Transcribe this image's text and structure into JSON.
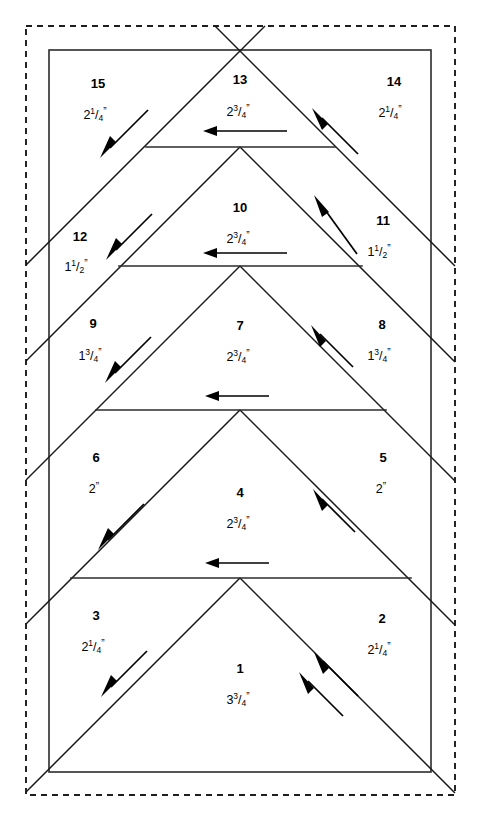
{
  "diagram": {
    "type": "technical-sewing-diagram",
    "colors": {
      "line": "#1b1b1b",
      "border": "#111111",
      "background": "#ffffff",
      "arrow": "#000000"
    },
    "outer_border": {
      "style": "dashed",
      "x": 26,
      "y": 26,
      "width": 429,
      "height": 769
    },
    "inner_border": {
      "style": "solid",
      "x": 49,
      "y": 50,
      "width": 382,
      "height": 722
    },
    "apex_x": 240,
    "row_lines_y": [
      51,
      147,
      266,
      410,
      578,
      772
    ],
    "pieces": [
      {
        "id": "1",
        "number": "1",
        "dimension": "3³/₄\"",
        "whole": "3",
        "numerator": "3",
        "denominator": "4",
        "unit": "\"",
        "x": 240,
        "y": 670,
        "dim_y": 701,
        "arrow": "double-up-right"
      },
      {
        "id": "2",
        "number": "2",
        "dimension": "2¹/₄\"",
        "whole": "2",
        "numerator": "1",
        "denominator": "4",
        "unit": "\"",
        "x": 382,
        "y": 620,
        "dim_y": 651,
        "arrow": "up-right"
      },
      {
        "id": "3",
        "number": "3",
        "dimension": "2¹/₄\"",
        "whole": "2",
        "numerator": "1",
        "denominator": "4",
        "unit": "\"",
        "x": 96,
        "y": 617,
        "dim_y": 648,
        "arrow": "down-left"
      },
      {
        "id": "4",
        "number": "4",
        "dimension": "2³/₄\"",
        "whole": "2",
        "numerator": "3",
        "denominator": "4",
        "unit": "\"",
        "x": 240,
        "y": 494,
        "dim_y": 525,
        "arrow": "left"
      },
      {
        "id": "5",
        "number": "5",
        "dimension": "2\"",
        "whole": "2",
        "numerator": "",
        "denominator": "",
        "unit": "\"",
        "x": 383,
        "y": 459,
        "dim_y": 490,
        "arrow": "up-right"
      },
      {
        "id": "6",
        "number": "6",
        "dimension": "2\"",
        "whole": "2",
        "numerator": "",
        "denominator": "",
        "unit": "\"",
        "x": 96,
        "y": 459,
        "dim_y": 490,
        "arrow": "down-left"
      },
      {
        "id": "7",
        "number": "7",
        "dimension": "2³/₄\"",
        "whole": "2",
        "numerator": "3",
        "denominator": "4",
        "unit": "\"",
        "x": 240,
        "y": 327,
        "dim_y": 358,
        "arrow": "left"
      },
      {
        "id": "8",
        "number": "8",
        "dimension": "1³/₄\"",
        "whole": "1",
        "numerator": "3",
        "denominator": "4",
        "unit": "\"",
        "x": 382,
        "y": 326,
        "dim_y": 357,
        "arrow": "up-right"
      },
      {
        "id": "9",
        "number": "9",
        "dimension": "1³/₄\"",
        "whole": "1",
        "numerator": "3",
        "denominator": "4",
        "unit": "\"",
        "x": 93,
        "y": 325,
        "dim_y": 356,
        "arrow": "down-left"
      },
      {
        "id": "10",
        "number": "10",
        "dimension": "2³/₄\"",
        "whole": "2",
        "numerator": "3",
        "denominator": "4",
        "unit": "\"",
        "x": 240,
        "y": 209,
        "dim_y": 240,
        "arrow": "left"
      },
      {
        "id": "11",
        "number": "11",
        "dimension": "1¹/₂\"",
        "whole": "1",
        "numerator": "1",
        "denominator": "2",
        "unit": "\"",
        "x": 383,
        "y": 222,
        "dim_y": 252,
        "arrow": "up-right"
      },
      {
        "id": "12",
        "number": "12",
        "dimension": "1¹/₂\"",
        "whole": "1",
        "numerator": "1",
        "denominator": "2",
        "unit": "\"",
        "x": 80,
        "y": 238,
        "dim_y": 267,
        "arrow": "down-left"
      },
      {
        "id": "13",
        "number": "13",
        "dimension": "2³/₄\"",
        "whole": "2",
        "numerator": "3",
        "denominator": "4",
        "unit": "\"",
        "x": 240,
        "y": 81,
        "dim_y": 113,
        "arrow": "left"
      },
      {
        "id": "14",
        "number": "14",
        "dimension": "2¹/₄\"",
        "whole": "2",
        "numerator": "1",
        "denominator": "4",
        "unit": "\"",
        "x": 394,
        "y": 83,
        "dim_y": 114,
        "arrow": "up-right"
      },
      {
        "id": "15",
        "number": "15",
        "dimension": "2¹/₄\"",
        "whole": "2",
        "numerator": "1",
        "denominator": "4",
        "unit": "\"",
        "x": 98,
        "y": 85,
        "dim_y": 116,
        "arrow": "down-left"
      }
    ],
    "arrows": [
      {
        "name": "arrow-piece-13-left",
        "x1": 285,
        "y1": 131,
        "x2": 204,
        "y2": 131,
        "dir": "left"
      },
      {
        "name": "arrow-piece-10-left",
        "x1": 285,
        "y1": 253,
        "x2": 204,
        "y2": 253,
        "dir": "left"
      },
      {
        "name": "arrow-piece-7-left",
        "x1": 267,
        "y1": 396,
        "x2": 206,
        "y2": 396,
        "dir": "left"
      },
      {
        "name": "arrow-piece-4-left",
        "x1": 267,
        "y1": 563,
        "x2": 206,
        "y2": 563,
        "dir": "left"
      },
      {
        "name": "arrow-piece-15-down",
        "x1": 148,
        "y1": 111,
        "x2": 100,
        "y2": 156,
        "dir": "down-left"
      },
      {
        "name": "arrow-piece-12-down",
        "x1": 153,
        "y1": 215,
        "x2": 108,
        "y2": 258,
        "dir": "down-left"
      },
      {
        "name": "arrow-piece-9-down",
        "x1": 152,
        "y1": 338,
        "x2": 107,
        "y2": 381,
        "dir": "down-left"
      },
      {
        "name": "arrow-piece-6-down",
        "x1": 145,
        "y1": 505,
        "x2": 100,
        "y2": 548,
        "dir": "down-left"
      },
      {
        "name": "arrow-piece-3-down",
        "x1": 148,
        "y1": 652,
        "x2": 103,
        "y2": 696,
        "dir": "down-left"
      },
      {
        "name": "arrow-piece-14-up",
        "x1": 358,
        "y1": 155,
        "x2": 313,
        "y2": 110,
        "dir": "up-right"
      },
      {
        "name": "arrow-piece-11-up",
        "x1": 358,
        "y1": 256,
        "x2": 314,
        "y2": 196,
        "dir": "up-right"
      },
      {
        "name": "arrow-piece-8-up",
        "x1": 353,
        "y1": 368,
        "x2": 312,
        "y2": 327,
        "dir": "up-right"
      },
      {
        "name": "arrow-piece-5-up",
        "x1": 355,
        "y1": 533,
        "x2": 314,
        "y2": 490,
        "dir": "up-right"
      },
      {
        "name": "arrow-piece-1-up-a",
        "x1": 358,
        "y1": 697,
        "x2": 315,
        "y2": 653,
        "dir": "up-right"
      },
      {
        "name": "arrow-piece-1-up-b",
        "x1": 343,
        "y1": 717,
        "x2": 300,
        "y2": 673,
        "dir": "up-right"
      }
    ]
  }
}
